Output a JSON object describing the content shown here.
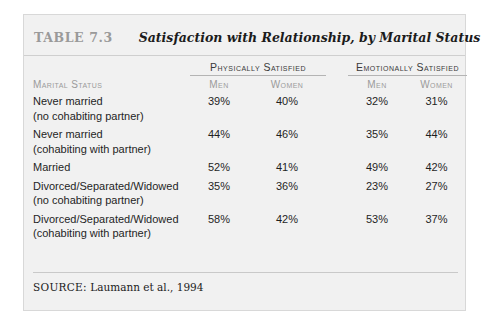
{
  "figure": {
    "caption_label": "TABLE 7.3",
    "caption_title": "Satisfaction with Relationship, by Marital Status",
    "source_label": "SOURCE:",
    "source_text": "Laumann et al., 1994"
  },
  "table": {
    "group_headers": [
      "",
      "Physically Satisfied",
      "",
      "Emotionally Satisfied"
    ],
    "column_headers": [
      "Marital Status",
      "Men",
      "Women",
      "Men",
      "Women"
    ],
    "rows": [
      {
        "label": "Never married",
        "sublabel": "(no cohabiting partner)",
        "physically_men": "39%",
        "physically_women": "40%",
        "emotionally_men": "32%",
        "emotionally_women": "31%"
      },
      {
        "label": "Never married",
        "sublabel": "(cohabiting with partner)",
        "physically_men": "44%",
        "physically_women": "46%",
        "emotionally_men": "35%",
        "emotionally_women": "44%"
      },
      {
        "label": "Married",
        "sublabel": "",
        "physically_men": "52%",
        "physically_women": "41%",
        "emotionally_men": "49%",
        "emotionally_women": "42%"
      },
      {
        "label": "Divorced/Separated/Widowed",
        "sublabel": "(no cohabiting partner)",
        "physically_men": "35%",
        "physically_women": "36%",
        "emotionally_men": "23%",
        "emotionally_women": "27%"
      },
      {
        "label": "Divorced/Separated/Widowed",
        "sublabel": "(cohabiting with partner)",
        "physically_men": "58%",
        "physically_women": "42%",
        "emotionally_men": "53%",
        "emotionally_women": "37%"
      }
    ]
  }
}
